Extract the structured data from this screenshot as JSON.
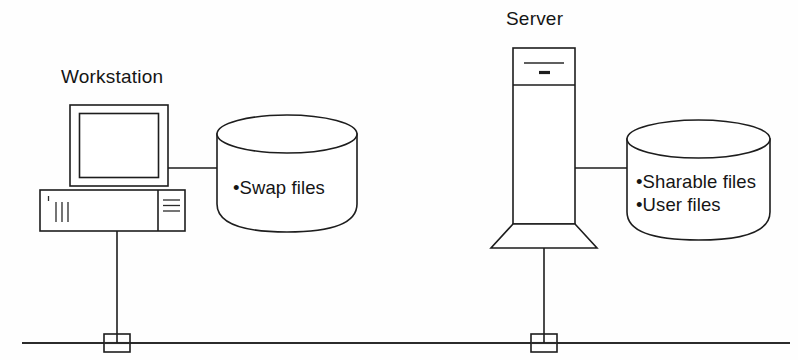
{
  "diagram": {
    "type": "network-topology",
    "background_color": "#fefefe",
    "line_color": "#1d1d1d",
    "nodes": {
      "workstation": {
        "title": "Workstation",
        "icon": "desktop-computer"
      },
      "server": {
        "title": "Server",
        "icon": "tower-server"
      },
      "workstation_disk": {
        "icon": "disk-cylinder",
        "lines": [
          "•Swap files"
        ]
      },
      "server_disk": {
        "icon": "disk-cylinder",
        "lines": [
          "•Sharable files",
          "•User files"
        ]
      }
    },
    "network": {
      "bus_label": "",
      "tap_count": 2
    }
  }
}
